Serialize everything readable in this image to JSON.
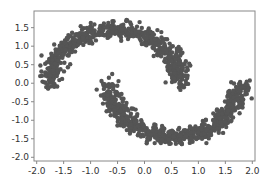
{
  "chart_data": {
    "type": "scatter",
    "title": "",
    "xlabel": "",
    "ylabel": "",
    "xlim": [
      -2.05,
      2.05
    ],
    "ylim": [
      -2.1,
      1.95
    ],
    "xticks": [
      "-2.0",
      "-1.5",
      "-1.0",
      "-0.5",
      "0.0",
      "0.5",
      "1.0",
      "1.5",
      "2.0"
    ],
    "yticks": [
      "1.5",
      "1.0",
      "0.5",
      "0.0",
      "-0.5",
      "-1.0",
      "-1.5",
      "-2.0"
    ],
    "grid": false,
    "legend": null,
    "point_color": "#555555",
    "series": [
      {
        "name": "upper moon",
        "shape": "arc",
        "center": [
          -0.55,
          0.0
        ],
        "radius": 1.25,
        "angle_range_deg": [
          0,
          180
        ],
        "noise": 0.1,
        "approx_points": [
          [
            -1.8,
            -0.4
          ],
          [
            -1.7,
            0.3
          ],
          [
            -1.4,
            0.9
          ],
          [
            -1.0,
            1.4
          ],
          [
            -0.5,
            1.6
          ],
          [
            0.0,
            1.4
          ],
          [
            0.4,
            0.9
          ],
          [
            0.6,
            0.3
          ],
          [
            0.6,
            -0.2
          ]
        ]
      },
      {
        "name": "lower moon",
        "shape": "arc",
        "center": [
          0.55,
          0.0
        ],
        "radius": 1.25,
        "angle_range_deg": [
          180,
          360
        ],
        "noise": 0.1,
        "approx_points": [
          [
            -0.6,
            0.6
          ],
          [
            -0.6,
            0.0
          ],
          [
            -0.3,
            -0.9
          ],
          [
            0.1,
            -1.4
          ],
          [
            0.6,
            -1.6
          ],
          [
            1.1,
            -1.3
          ],
          [
            1.5,
            -0.7
          ],
          [
            1.75,
            0.0
          ],
          [
            1.8,
            0.6
          ]
        ]
      }
    ]
  }
}
